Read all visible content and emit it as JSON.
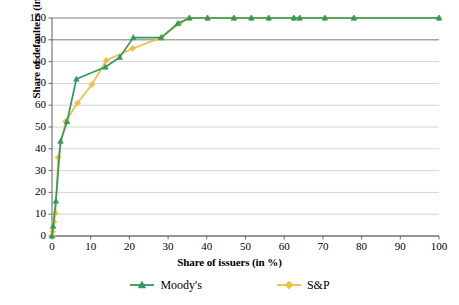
{
  "chart_data": {
    "type": "line",
    "title": "",
    "xlabel": "Share of issuers (in %)",
    "ylabel": "Share of defaulters (in %)",
    "xlim": [
      0,
      100
    ],
    "ylim": [
      0,
      100
    ],
    "xticks": [
      0,
      10,
      20,
      30,
      40,
      50,
      60,
      70,
      80,
      90,
      100
    ],
    "yticks": [
      0,
      10,
      20,
      30,
      40,
      50,
      60,
      70,
      80,
      90,
      100
    ],
    "grid": "horizontal",
    "legend_position": "bottom",
    "series": [
      {
        "name": "Moody's",
        "color": "#2E9B5F",
        "marker": "triangle",
        "points": [
          [
            0.0,
            0.0
          ],
          [
            0.3,
            4.5
          ],
          [
            1.0,
            16.0
          ],
          [
            2.2,
            43.5
          ],
          [
            3.9,
            52.5
          ],
          [
            6.3,
            72.0
          ],
          [
            13.8,
            77.5
          ],
          [
            17.5,
            82.0
          ],
          [
            21.0,
            91.0
          ],
          [
            28.2,
            91.0
          ],
          [
            32.5,
            97.5
          ],
          [
            35.5,
            100.0
          ],
          [
            40.2,
            100.0
          ],
          [
            47.0,
            100.0
          ],
          [
            51.5,
            100.0
          ],
          [
            56.0,
            100.0
          ],
          [
            62.5,
            100.0
          ],
          [
            64.0,
            100.0
          ],
          [
            70.5,
            100.0
          ],
          [
            78.0,
            100.0
          ],
          [
            100.0,
            100.0
          ]
        ]
      },
      {
        "name": "S&P",
        "color": "#F2BE40",
        "marker": "diamond",
        "points": [
          [
            0.0,
            0.0
          ],
          [
            0.2,
            2.0
          ],
          [
            0.5,
            6.5
          ],
          [
            0.9,
            10.5
          ],
          [
            1.6,
            36.0
          ],
          [
            3.5,
            52.5
          ],
          [
            6.6,
            61.0
          ],
          [
            10.3,
            69.5
          ],
          [
            14.0,
            80.5
          ],
          [
            20.8,
            86.0
          ],
          [
            28.3,
            91.0
          ],
          [
            33.0,
            97.5
          ],
          [
            35.5,
            100.0
          ],
          [
            40.2,
            100.0
          ],
          [
            47.0,
            100.0
          ],
          [
            51.5,
            100.0
          ],
          [
            56.0,
            100.0
          ],
          [
            62.5,
            100.0
          ],
          [
            64.0,
            100.0
          ],
          [
            70.5,
            100.0
          ],
          [
            78.0,
            100.0
          ],
          [
            100.0,
            100.0
          ]
        ]
      }
    ]
  },
  "legend": {
    "items": [
      {
        "label": "Moody's"
      },
      {
        "label": "S&P"
      }
    ]
  }
}
